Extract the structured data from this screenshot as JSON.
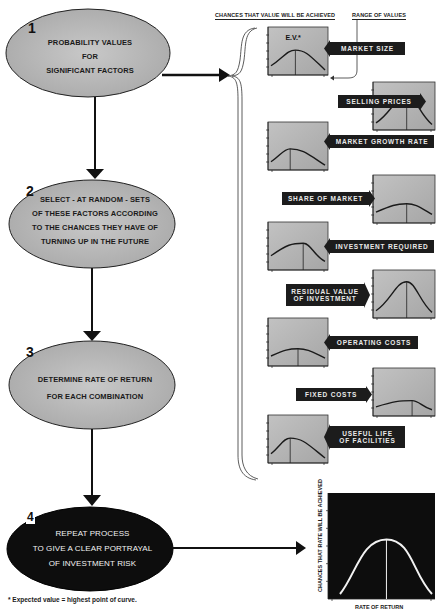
{
  "steps": [
    {
      "number": "1",
      "lines": [
        "PROBABILITY VALUES",
        "FOR",
        "SIGNIFICANT FACTORS"
      ]
    },
    {
      "number": "2",
      "lines": [
        "SELECT - AT RANDOM - SETS",
        "OF THESE FACTORS  ACCORDING",
        "TO THE CHANCES THEY HAVE OF",
        "TURNING UP IN THE FUTURE"
      ]
    },
    {
      "number": "3",
      "lines": [
        "DETERMINE RATE OF RETURN",
        "FOR EACH COMBINATION"
      ]
    },
    {
      "number": "4",
      "lines": [
        "REPEAT PROCESS",
        "TO GIVE A CLEAR PORTRAYAL",
        "OF INVESTMENT RISK"
      ]
    }
  ],
  "headers": {
    "chances": "CHANCES THAT VALUE WILL BE ACHIEVED",
    "range": "RANGE OF VALUES",
    "ev": "E.V.*"
  },
  "factors": [
    {
      "label": "MARKET SIZE",
      "line2": "",
      "peak": 0.45,
      "height": 0.55,
      "skew": "right-tail"
    },
    {
      "label": "SELLING PRICES",
      "line2": "",
      "peak": 0.55,
      "height": 0.8,
      "skew": "narrow"
    },
    {
      "label": "MARKET GROWTH RATE",
      "line2": "",
      "peak": 0.35,
      "height": 0.45,
      "skew": "right-tail"
    },
    {
      "label": "SHARE OF MARKET",
      "line2": "",
      "peak": 0.55,
      "height": 0.4,
      "skew": "flat"
    },
    {
      "label": "INVESTMENT REQUIRED",
      "line2": "",
      "peak": 0.6,
      "height": 0.6,
      "skew": "left-tail"
    },
    {
      "label": "RESIDUAL VALUE",
      "line2": "OF INVESTMENT",
      "peak": 0.55,
      "height": 0.85,
      "skew": "narrow"
    },
    {
      "label": "OPERATING COSTS",
      "line2": "",
      "peak": 0.5,
      "height": 0.35,
      "skew": "flat"
    },
    {
      "label": "FIXED COSTS",
      "line2": "",
      "peak": 0.65,
      "height": 0.3,
      "skew": "left-tail"
    },
    {
      "label": "USEFUL LIFE",
      "line2": "OF FACILITIES",
      "peak": 0.35,
      "height": 0.55,
      "skew": "right-tail"
    }
  ],
  "result": {
    "ylabel": "CHANCES THAT RATE WILL BE ACHIEVED",
    "xlabel": "RATE OF RETURN",
    "peak": 0.55,
    "height": 0.6
  },
  "footnote": "* Expected  value = highest point of curve.",
  "colors": {
    "ellipse_fill": "#b4b4b4",
    "ellipse_dark": "#0d0d0d",
    "chart_fill": "#b0b0b0",
    "label_fill": "#1c1c1c"
  }
}
